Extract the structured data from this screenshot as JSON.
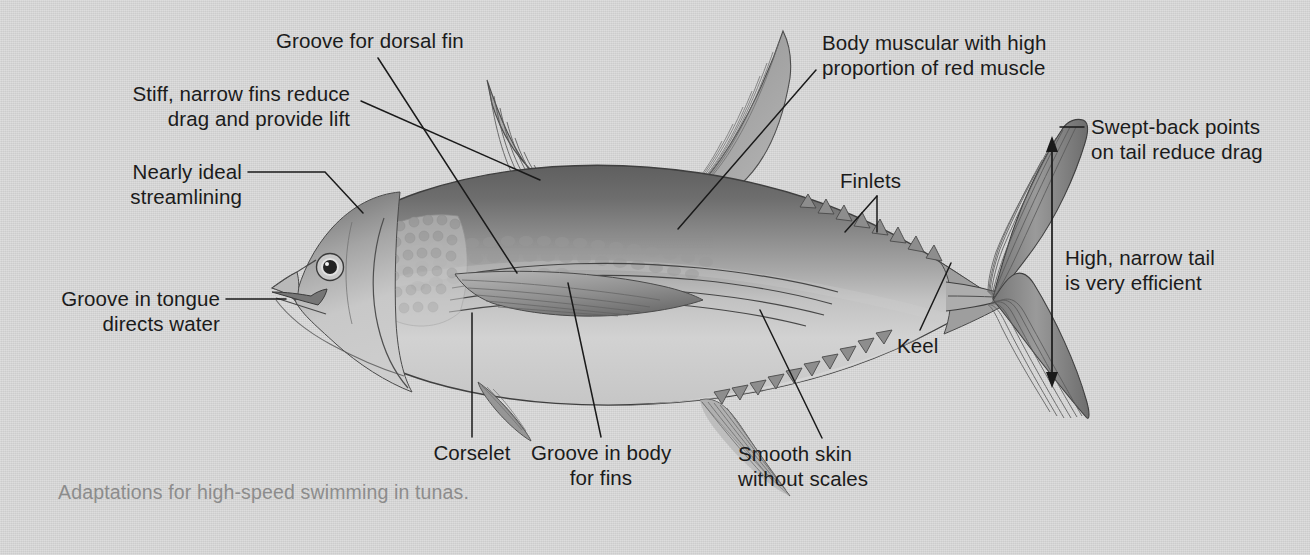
{
  "figure": {
    "subject": "tuna",
    "caption": "Adaptations for high-speed swimming in tunas.",
    "background_color": "#d4d4d4",
    "label_color": "#1b1b1b",
    "caption_color": "#8c8c8c",
    "leader_line_color": "#1a1a1a"
  },
  "labels": {
    "groove_for_dorsal_fin": "Groove for dorsal fin",
    "stiff_fins_line1": "Stiff, narrow fins reduce",
    "stiff_fins_line2": "drag and provide lift",
    "streamlining_line1": "Nearly ideal",
    "streamlining_line2": "streamlining",
    "groove_tongue_line1": "Groove in tongue",
    "groove_tongue_line2": "directs water",
    "corselet": "Corselet",
    "groove_body_line1": "Groove in body",
    "groove_body_line2": "for fins",
    "smooth_skin_line1": "Smooth skin",
    "smooth_skin_line2": "without scales",
    "body_muscular_line1": "Body muscular with high",
    "body_muscular_line2": "proportion of red muscle",
    "finlets": "Finlets",
    "keel": "Keel",
    "swept_back_line1": "Swept-back points",
    "swept_back_line2": "on tail reduce drag",
    "high_narrow_tail_line1": "High, narrow tail",
    "high_narrow_tail_line2": "is very efficient"
  },
  "anatomy_parts": [
    "head",
    "eye",
    "mouth",
    "tongue groove",
    "corselet",
    "pectoral fin",
    "first dorsal fin",
    "second dorsal fin",
    "dorsal finlets",
    "anal fin",
    "anal finlets",
    "pelvic fin",
    "caudal keel",
    "caudal fin (tail)",
    "body groove for fins",
    "smooth skin"
  ],
  "measurement": {
    "name": "tail-height-arrow",
    "description": "double-headed vertical arrow spanning tail height"
  }
}
